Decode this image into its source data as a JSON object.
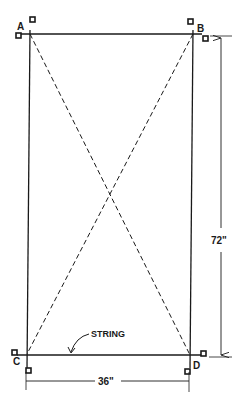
{
  "diagram": {
    "type": "layout-squaring",
    "corners": [
      {
        "label": "A",
        "x": 30,
        "y": 34
      },
      {
        "label": "B",
        "x": 193,
        "y": 34
      },
      {
        "label": "C",
        "x": 27,
        "y": 354
      },
      {
        "label": "D",
        "x": 190,
        "y": 355
      }
    ],
    "dimensions": {
      "height_label": "72\"",
      "width_label": "36\""
    },
    "annotations": {
      "string_label": "STRING"
    },
    "colors": {
      "line": "#1a1a1a",
      "background": "#ffffff"
    }
  }
}
